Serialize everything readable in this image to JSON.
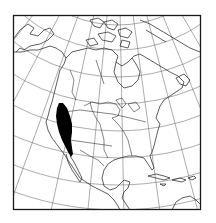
{
  "map": {
    "subject": "North America range map",
    "projection": "conic",
    "frame": {
      "x": 13,
      "y": 15,
      "width": 188,
      "height": 195
    },
    "colors": {
      "background": "#ffffff",
      "frame": "#1a1a1a",
      "graticule": "#555555",
      "coastline": "#2a2a2a",
      "range_fill": "#000000"
    },
    "range": {
      "description": "Shaded distribution area along Pacific coast (California / southern Oregon)",
      "fill": "#000000"
    },
    "labels": []
  }
}
